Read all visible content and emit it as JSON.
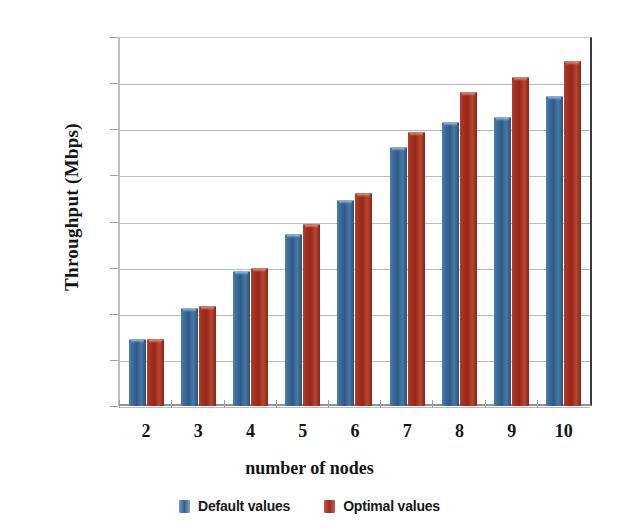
{
  "chart_data": {
    "type": "bar",
    "title": "",
    "xlabel": "number of nodes",
    "ylabel": "Throughput (Mbps)",
    "categories": [
      "2",
      "3",
      "4",
      "5",
      "6",
      "7",
      "8",
      "9",
      "10"
    ],
    "series": [
      {
        "name": "Default values",
        "color": "#35608f",
        "values": [
          0.29,
          0.425,
          0.585,
          0.745,
          0.895,
          1.125,
          1.23,
          1.255,
          1.345
        ]
      },
      {
        "name": "Optimal values",
        "color": "#a5301f",
        "values": [
          0.29,
          0.435,
          0.6,
          0.79,
          0.925,
          1.19,
          1.36,
          1.425,
          1.495
        ]
      }
    ],
    "ylim": [
      0,
      1.6
    ],
    "ytick_labels": [
      "1.6",
      "1.4",
      "1.2",
      "1",
      "0.8",
      "0.6",
      "0.4",
      "0.2",
      "0"
    ],
    "ytick_values": [
      1.6,
      1.4,
      1.2,
      1.0,
      0.8,
      0.6,
      0.4,
      0.2,
      0
    ],
    "grid": true,
    "legend_position": "bottom"
  },
  "legend": {
    "items": [
      {
        "label": "Default values",
        "swatch": "legend-swatch-blue"
      },
      {
        "label": "Optimal values",
        "swatch": "legend-swatch-red"
      }
    ]
  }
}
